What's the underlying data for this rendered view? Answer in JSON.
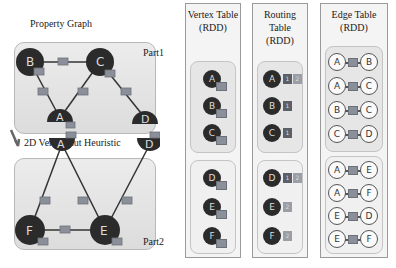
{
  "graph": {
    "title": "Property Graph",
    "heuristic_label": "2D Vertex Cut Heuristic",
    "part1": {
      "label": "Part1",
      "vertices": [
        "B",
        "C",
        "A",
        "D"
      ],
      "edges": [
        [
          "B",
          "C"
        ],
        [
          "B",
          "A"
        ],
        [
          "A",
          "C"
        ],
        [
          "C",
          "D"
        ]
      ]
    },
    "part2": {
      "label": "Part2",
      "vertices": [
        "A",
        "D",
        "F",
        "E"
      ],
      "edges": [
        [
          "A",
          "F"
        ],
        [
          "A",
          "E"
        ],
        [
          "D",
          "E"
        ],
        [
          "F",
          "E"
        ]
      ]
    }
  },
  "vertex_table": {
    "title_line1": "Vertex Table",
    "title_line2": "(RDD)",
    "groups": [
      [
        "A",
        "B",
        "C"
      ],
      [
        "D",
        "E",
        "F"
      ]
    ]
  },
  "routing_table": {
    "title_line1": "Routing",
    "title_line2": "Table",
    "title_line3": "(RDD)",
    "rows": [
      {
        "vertex": "A",
        "parts": [
          "1",
          "2"
        ]
      },
      {
        "vertex": "B",
        "parts": [
          "1"
        ]
      },
      {
        "vertex": "C",
        "parts": [
          "1"
        ]
      },
      {
        "vertex": "D",
        "parts": [
          "1",
          "2"
        ]
      },
      {
        "vertex": "E",
        "parts": [
          "2"
        ]
      },
      {
        "vertex": "F",
        "parts": [
          "2"
        ]
      }
    ]
  },
  "edge_table": {
    "title_line1": "Edge Table",
    "title_line2": "(RDD)",
    "groups": [
      [
        [
          "A",
          "B"
        ],
        [
          "A",
          "C"
        ],
        [
          "B",
          "C"
        ],
        [
          "C",
          "D"
        ]
      ],
      [
        [
          "A",
          "E"
        ],
        [
          "A",
          "F"
        ],
        [
          "E",
          "D"
        ],
        [
          "E",
          "F"
        ]
      ]
    ]
  },
  "colors": {
    "vertex_fill": "#2b2b2b",
    "edge_box": "#8a8f9a",
    "part1_badge": "#5a5f68",
    "part2_badge": "#9a9ea6"
  }
}
